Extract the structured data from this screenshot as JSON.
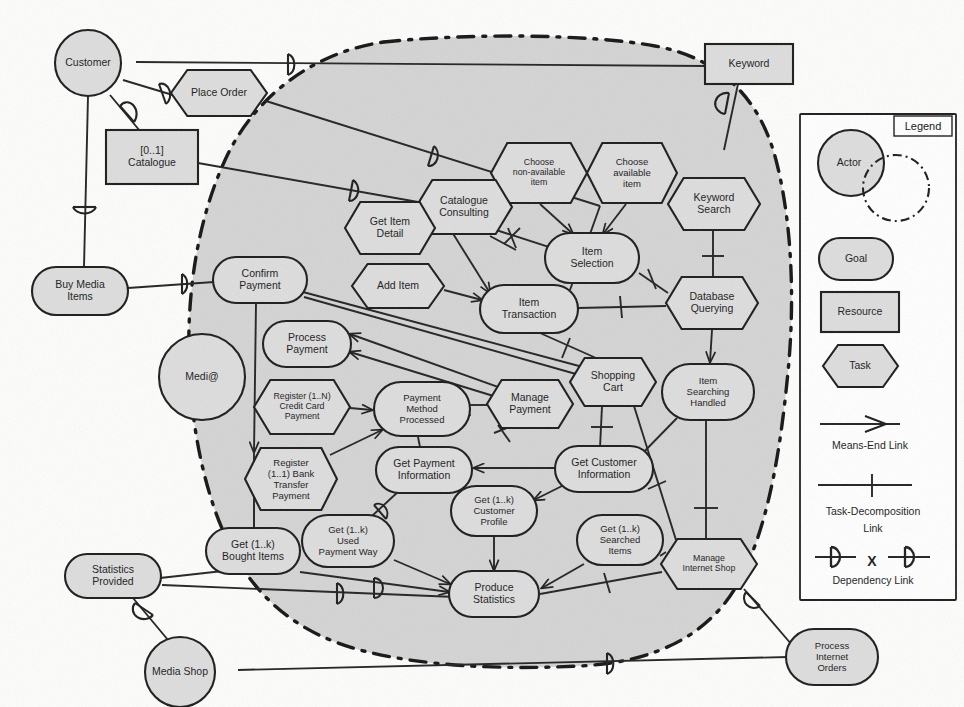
{
  "diagram": {
    "boundary_actor": "Medi@",
    "colors": {
      "shape_fill": "#dddddd",
      "boundary_fill": "#d4d4d4",
      "stroke": "#1b1b1b",
      "legend_fill": "#ffffff",
      "page_bg": "#fdfdfc"
    }
  },
  "legend": {
    "title": "Legend",
    "items": [
      {
        "key": "actor",
        "label": "Actor",
        "shape": "circle-with-dashed-boundary"
      },
      {
        "key": "goal",
        "label": "Goal",
        "shape": "rounded-rectangle"
      },
      {
        "key": "resource",
        "label": "Resource",
        "shape": "rectangle"
      },
      {
        "key": "task",
        "label": "Task",
        "shape": "hexagon"
      }
    ],
    "links": [
      {
        "key": "means-end",
        "label": "Means-End Link",
        "glyph": "open-arrow"
      },
      {
        "key": "task-decomposition",
        "label": "Task-Decomposition\nLink",
        "glyph": "tick-mark"
      },
      {
        "key": "dependency",
        "label": "Dependency Link",
        "glyph": "D-D"
      }
    ],
    "dependency_separator": "X"
  },
  "nodes": [
    {
      "id": "customer",
      "label": "Customer",
      "type": "actor",
      "x": 88,
      "y": 63,
      "w": 96,
      "h": 66
    },
    {
      "id": "medi-a",
      "label": "Medi@",
      "type": "actor",
      "x": 202,
      "y": 377,
      "w": 86,
      "h": 86
    },
    {
      "id": "media-shop",
      "label": "Media Shop",
      "type": "actor",
      "x": 180,
      "y": 672,
      "w": 116,
      "h": 70
    },
    {
      "id": "place-order",
      "label": "Place Order",
      "type": "task",
      "x": 219,
      "y": 93,
      "w": 96,
      "h": 46
    },
    {
      "id": "catalogue",
      "label": "[0..1]\nCatalogue",
      "type": "resource",
      "x": 152,
      "y": 157,
      "w": 92,
      "h": 54
    },
    {
      "id": "keyword",
      "label": "Keyword",
      "type": "resource",
      "x": 749,
      "y": 64,
      "w": 88,
      "h": 40
    },
    {
      "id": "buy-media-items",
      "label": "Buy Media\nItems",
      "type": "goal",
      "x": 80,
      "y": 291,
      "w": 96,
      "h": 48
    },
    {
      "id": "statistics-provided",
      "label": "Statistics\nProvided",
      "type": "goal",
      "x": 113,
      "y": 576,
      "w": 96,
      "h": 44
    },
    {
      "id": "process-internet-orders",
      "label": "Process\nInternet\nOrders",
      "type": "goal",
      "x": 832,
      "y": 657,
      "w": 92,
      "h": 56
    },
    {
      "id": "choose-non-available",
      "label": "Choose\nnon-available\nitem",
      "type": "task",
      "x": 539,
      "y": 173,
      "w": 96,
      "h": 60
    },
    {
      "id": "choose-available",
      "label": "Choose\navailable\nitem",
      "type": "task",
      "x": 632,
      "y": 173,
      "w": 90,
      "h": 60
    },
    {
      "id": "keyword-search",
      "label": "Keyword\nSearch",
      "type": "task",
      "x": 714,
      "y": 204,
      "w": 92,
      "h": 52
    },
    {
      "id": "catalogue-consulting",
      "label": "Catalogue\nConsulting",
      "type": "task",
      "x": 464,
      "y": 207,
      "w": 96,
      "h": 54
    },
    {
      "id": "get-item-detail",
      "label": "Get Item\nDetail",
      "type": "task",
      "x": 390,
      "y": 228,
      "w": 90,
      "h": 52
    },
    {
      "id": "add-item",
      "label": "Add Item",
      "type": "task",
      "x": 398,
      "y": 286,
      "w": 92,
      "h": 44
    },
    {
      "id": "item-selection",
      "label": "Item\nSelection",
      "type": "goal",
      "x": 592,
      "y": 258,
      "w": 94,
      "h": 50
    },
    {
      "id": "item-transaction",
      "label": "Item\nTransaction",
      "type": "goal",
      "x": 529,
      "y": 309,
      "w": 98,
      "h": 48
    },
    {
      "id": "database-querying",
      "label": "Database\nQuerying",
      "type": "task",
      "x": 712,
      "y": 303,
      "w": 92,
      "h": 52
    },
    {
      "id": "confirm-payment",
      "label": "Confirm\nPayment",
      "type": "goal",
      "x": 260,
      "y": 280,
      "w": 94,
      "h": 46
    },
    {
      "id": "process-payment",
      "label": "Process\nPayment",
      "type": "goal",
      "x": 307,
      "y": 344,
      "w": 88,
      "h": 46
    },
    {
      "id": "register-credit-card",
      "label": "Register (1..N)\nCredit Card\nPayment",
      "type": "task",
      "x": 302,
      "y": 407,
      "w": 96,
      "h": 54
    },
    {
      "id": "register-bank-transfer",
      "label": "Register\n(1..1) Bank\nTransfer\nPayment",
      "type": "task",
      "x": 291,
      "y": 479,
      "w": 92,
      "h": 62
    },
    {
      "id": "payment-method-processed",
      "label": "Payment\nMethod\nProcessed",
      "type": "goal",
      "x": 422,
      "y": 409,
      "w": 96,
      "h": 54
    },
    {
      "id": "get-payment-information",
      "label": "Get Payment\nInformation",
      "type": "goal",
      "x": 424,
      "y": 470,
      "w": 96,
      "h": 46
    },
    {
      "id": "manage-payment",
      "label": "Manage\nPayment",
      "type": "task",
      "x": 530,
      "y": 404,
      "w": 86,
      "h": 48
    },
    {
      "id": "shopping-cart",
      "label": "Shopping\nCart",
      "type": "task",
      "x": 613,
      "y": 382,
      "w": 86,
      "h": 48
    },
    {
      "id": "item-searching-handled",
      "label": "Item\nSearching\nHandled",
      "type": "goal",
      "x": 708,
      "y": 392,
      "w": 92,
      "h": 56
    },
    {
      "id": "get-customer-information",
      "label": "Get Customer\nInformation",
      "type": "goal",
      "x": 604,
      "y": 469,
      "w": 98,
      "h": 46
    },
    {
      "id": "get-customer-profile",
      "label": "Get (1..k)\nCustomer\nProfile",
      "type": "goal",
      "x": 494,
      "y": 511,
      "w": 86,
      "h": 50
    },
    {
      "id": "get-bought-items",
      "label": "Get (1..k)\nBought Items",
      "type": "goal",
      "x": 253,
      "y": 551,
      "w": 94,
      "h": 46
    },
    {
      "id": "get-used-payment-way",
      "label": "Get (1..k)\nUsed\nPayment Way",
      "type": "goal",
      "x": 348,
      "y": 541,
      "w": 92,
      "h": 52
    },
    {
      "id": "get-searched-items",
      "label": "Get (1..k)\nSearched\nItems",
      "type": "goal",
      "x": 620,
      "y": 540,
      "w": 86,
      "h": 50
    },
    {
      "id": "produce-statistics",
      "label": "Produce\nStatistics",
      "type": "goal",
      "x": 494,
      "y": 594,
      "w": 90,
      "h": 46
    },
    {
      "id": "manage-internet-shop",
      "label": "Manage\nInternet Shop",
      "type": "task",
      "x": 709,
      "y": 564,
      "w": 96,
      "h": 50
    }
  ],
  "edges": [
    {
      "id": "customer-keyword",
      "from": "Customer",
      "to": "Keyword",
      "kind": "dependency"
    },
    {
      "id": "customer-place-order",
      "from": "Customer",
      "to": "Place Order",
      "kind": "dependency"
    },
    {
      "id": "customer-catalogue",
      "from": "Customer",
      "to": "Catalogue",
      "kind": "dependency"
    },
    {
      "id": "customer-buy-media-items",
      "from": "Customer",
      "to": "Buy Media Items",
      "kind": "dependency"
    },
    {
      "id": "buy-media-confirm-payment",
      "from": "Buy Media Items",
      "to": "Confirm Payment",
      "kind": "dependency"
    },
    {
      "id": "place-order-item-transaction",
      "from": "Place Order",
      "to": "Item Transaction",
      "kind": "dependency"
    },
    {
      "id": "catalogue-catalogue-consulting",
      "from": "Catalogue",
      "to": "Catalogue Consulting",
      "kind": "dependency"
    },
    {
      "id": "choose-non-available-item-selection",
      "from": "Choose non-available item",
      "to": "Item Selection",
      "kind": "means-end"
    },
    {
      "id": "choose-available-item-selection",
      "from": "Choose available item",
      "to": "Item Selection",
      "kind": "means-end"
    },
    {
      "id": "keyword-search-database-querying",
      "from": "Keyword Search",
      "to": "Database Querying",
      "kind": "task-decomposition"
    },
    {
      "id": "database-querying-item-searching",
      "from": "Database Querying",
      "to": "Item Searching Handled",
      "kind": "means-end"
    },
    {
      "id": "catalogue-consulting-item-transaction",
      "from": "Catalogue Consulting",
      "to": "Item Transaction",
      "kind": "task-decomposition"
    },
    {
      "id": "add-item-item-transaction",
      "from": "Add Item",
      "to": "Item Transaction",
      "kind": "means-end"
    },
    {
      "id": "item-selection-database-querying",
      "from": "Item Selection",
      "to": "Database Querying",
      "kind": "task-decomposition"
    },
    {
      "id": "item-transaction-database-querying",
      "from": "Item Transaction",
      "to": "Database Querying",
      "kind": "task-decomposition"
    },
    {
      "id": "confirm-payment-register-bank",
      "from": "Confirm Payment",
      "to": "Register (1..1) Bank Transfer Payment",
      "kind": "means-end"
    },
    {
      "id": "register-credit-payment-method",
      "from": "Register (1..N) Credit Card Payment",
      "to": "Payment Method Processed",
      "kind": "means-end"
    },
    {
      "id": "register-bank-payment-method",
      "from": "Register (1..1) Bank Transfer Payment",
      "to": "Payment Method Processed",
      "kind": "means-end"
    },
    {
      "id": "manage-payment-process-payment",
      "from": "Manage Payment",
      "to": "Process Payment",
      "kind": "means-end"
    },
    {
      "id": "shopping-cart-get-customer-information",
      "from": "Shopping Cart",
      "to": "Get Customer Information",
      "kind": "task-decomposition"
    },
    {
      "id": "get-customer-information-get-customer-profile",
      "from": "Get Customer Information",
      "to": "Get (1..k) Customer Profile",
      "kind": "means-end"
    },
    {
      "id": "get-customer-profile-produce-statistics",
      "from": "Get (1..k) Customer Profile",
      "to": "Produce Statistics",
      "kind": "means-end"
    },
    {
      "id": "get-searched-items-produce-statistics",
      "from": "Get (1..k) Searched Items",
      "to": "Produce Statistics",
      "kind": "means-end"
    },
    {
      "id": "get-bought-items-produce-statistics",
      "from": "Get (1..k) Bought Items",
      "to": "Produce Statistics",
      "kind": "means-end"
    },
    {
      "id": "get-used-payment-way-produce-statistics",
      "from": "Get (1..k) Used Payment Way",
      "to": "Produce Statistics",
      "kind": "means-end"
    },
    {
      "id": "manage-internet-shop-produce-statistics",
      "from": "Manage Internet Shop",
      "to": "Produce Statistics",
      "kind": "task-decomposition"
    },
    {
      "id": "statistics-provided-media-shop",
      "from": "Statistics Provided",
      "to": "Media Shop",
      "kind": "dependency"
    },
    {
      "id": "media-shop-process-internet-orders",
      "from": "Media Shop",
      "to": "Process Internet Orders",
      "kind": "dependency"
    },
    {
      "id": "manage-internet-shop-process-internet-orders",
      "from": "Manage Internet Shop",
      "to": "Process Internet Orders",
      "kind": "dependency"
    },
    {
      "id": "get-bought-items-statistics-provided",
      "from": "Get (1..k) Bought Items",
      "to": "Statistics Provided",
      "kind": "dependency"
    }
  ]
}
